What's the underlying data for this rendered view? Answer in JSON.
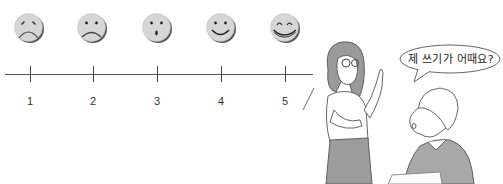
{
  "rating_scale": {
    "faces": [
      {
        "icon": "very-sad-face-icon",
        "value": 1
      },
      {
        "icon": "sad-face-icon",
        "value": 2
      },
      {
        "icon": "surprised-face-icon",
        "value": 3
      },
      {
        "icon": "smile-face-icon",
        "value": 4
      },
      {
        "icon": "big-smile-face-icon",
        "value": 5
      }
    ],
    "labels": [
      "1",
      "2",
      "3",
      "4",
      "5"
    ],
    "colors": {
      "face_fill": "#d4d4d4",
      "face_shadow": "#555555",
      "line": "#555555"
    }
  },
  "illustration": {
    "characters": [
      "teacher",
      "student"
    ],
    "speech_bubble": "제 쓰기가 어때요?"
  }
}
